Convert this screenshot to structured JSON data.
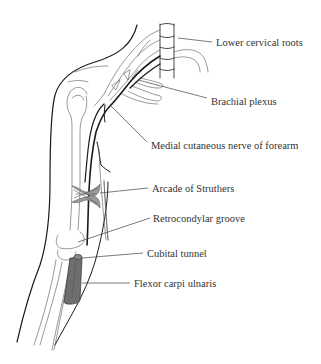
{
  "figure": {
    "labels": [
      {
        "id": "lower-cervical-roots",
        "text": "Lower cervical roots"
      },
      {
        "id": "brachial-plexus",
        "text": "Brachial plexus"
      },
      {
        "id": "medial-cutaneous-nerve",
        "text": "Medial cutaneous nerve of forearm"
      },
      {
        "id": "arcade-of-struthers",
        "text": "Arcade of Struthers"
      },
      {
        "id": "retrocondylar-groove",
        "text": "Retrocondylar groove"
      },
      {
        "id": "cubital-tunnel",
        "text": "Cubital tunnel"
      },
      {
        "id": "flexor-carpi-ulnaris",
        "text": "Flexor carpi ulnaris"
      }
    ],
    "colors": {
      "nerve": "#111111",
      "outline": "#1a1a1a",
      "arcade_fill": "#9a9a9a",
      "fcu_fill": "#6e6e6e",
      "label_text": "#333333"
    }
  }
}
